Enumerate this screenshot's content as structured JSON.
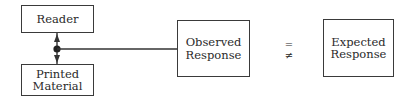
{
  "diagram": {
    "nodes": [
      {
        "id": "reader",
        "label": "Reader"
      },
      {
        "id": "printed_material",
        "label": "Printed\nMaterial"
      },
      {
        "id": "observed_response",
        "label": "Observed\nResponse"
      },
      {
        "id": "expected_response",
        "label": "Expected\nResponse"
      }
    ],
    "comparison_symbols": {
      "equal": "=",
      "not_equal": "≠"
    },
    "edges": [
      {
        "from": "reader",
        "to": "printed_material",
        "type": "bidirectional-arrow"
      },
      {
        "from": "junction",
        "to": "observed_response",
        "type": "line"
      }
    ]
  }
}
